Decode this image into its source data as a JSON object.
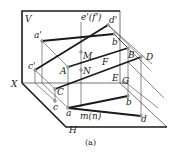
{
  "figure": {
    "caption": "(a)",
    "planes": {
      "vertical": "V",
      "horizontal": "H",
      "axis": "X"
    },
    "labels": {
      "a_prime": "a'",
      "b_prime": "b'",
      "c_prime": "c'",
      "d_prime": "d'",
      "ef_prime": "e'(f')",
      "A": "A",
      "B": "B",
      "C": "C",
      "D": "D",
      "E": "E",
      "F": "F",
      "G": "G",
      "M": "M",
      "N": "N",
      "a": "a",
      "b": "b",
      "c": "c",
      "d": "d",
      "mn": "m(n)"
    },
    "colors": {
      "line": "#1a1a1a",
      "background": "#ffffff"
    }
  }
}
